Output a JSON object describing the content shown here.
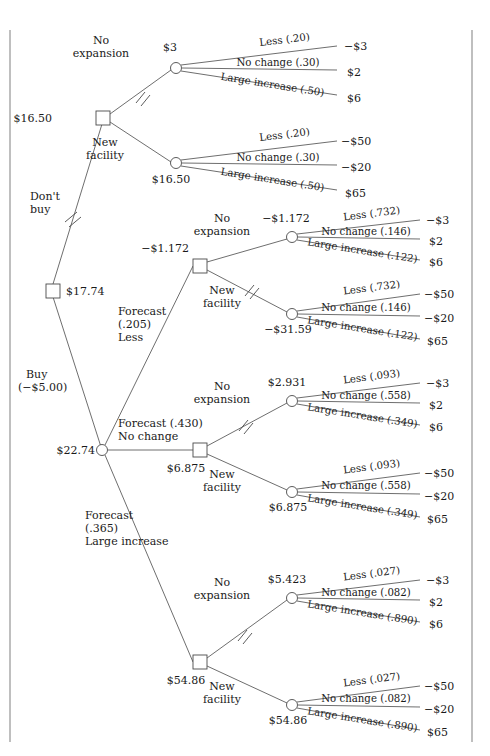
{
  "figure": {
    "type": "decision-tree"
  },
  "root": {
    "node_type": "decision",
    "value": "$17.74",
    "branches": {
      "dont_buy": "Don't\nbuy",
      "dont_buy_l1": "Don't",
      "dont_buy_l2": "buy",
      "buy_l1": "Buy",
      "buy_l2": "(−$5.00)"
    }
  },
  "no_forecast": {
    "decision_value": "$16.50",
    "branch_no_expansion_l1": "No",
    "branch_no_expansion_l2": "expansion",
    "branch_new_facility_l1": "New",
    "branch_new_facility_l2": "facility",
    "chance_no_expansion": {
      "value": "$3",
      "outcomes": [
        {
          "label": "Less (.20)",
          "payoff": "−$3"
        },
        {
          "label": "No change (.30)",
          "payoff": "$2"
        },
        {
          "label": "Large increase (.50)",
          "payoff": "$6"
        }
      ]
    },
    "chance_new_facility": {
      "value": "$16.50",
      "outcomes": [
        {
          "label": "Less (.20)",
          "payoff": "−$50"
        },
        {
          "label": "No change (.30)",
          "payoff": "−$20"
        },
        {
          "label": "Large increase (.50)",
          "payoff": "$65"
        }
      ]
    }
  },
  "buy_forecast": {
    "chance_value": "$22.74",
    "forecasts": [
      {
        "id": "less",
        "label_l1": "Forecast",
        "label_l2": "(.205)",
        "label_l3": "Less",
        "decision_value": "−$1.172",
        "branch_no_expansion_l1": "No",
        "branch_no_expansion_l2": "expansion",
        "branch_new_facility_l1": "New",
        "branch_new_facility_l2": "facility",
        "chance_no_expansion": {
          "value": "−$1.172",
          "outcomes": [
            {
              "label": "Less (.732)",
              "payoff": "−$3"
            },
            {
              "label": "No change (.146)",
              "payoff": "$2"
            },
            {
              "label": "Large increase (.122)",
              "payoff": "$6"
            }
          ]
        },
        "chance_new_facility": {
          "value": "−$31.59",
          "outcomes": [
            {
              "label": "Less (.732)",
              "payoff": "−$50"
            },
            {
              "label": "No change (.146)",
              "payoff": "−$20"
            },
            {
              "label": "Large increase (.122)",
              "payoff": "$65"
            }
          ]
        }
      },
      {
        "id": "no-change",
        "label_l1": "Forecast (.430)",
        "label_l2": "No change",
        "label_l3": "",
        "decision_value": "$6.875",
        "branch_no_expansion_l1": "No",
        "branch_no_expansion_l2": "expansion",
        "branch_new_facility_l1": "New",
        "branch_new_facility_l2": "facility",
        "chance_no_expansion": {
          "value": "$2.931",
          "outcomes": [
            {
              "label": "Less (.093)",
              "payoff": "−$3"
            },
            {
              "label": "No change (.558)",
              "payoff": "$2"
            },
            {
              "label": "Large increase (.349)",
              "payoff": "$6"
            }
          ]
        },
        "chance_new_facility": {
          "value": "$6.875",
          "outcomes": [
            {
              "label": "Less (.093)",
              "payoff": "−$50"
            },
            {
              "label": "No change (.558)",
              "payoff": "−$20"
            },
            {
              "label": "Large increase (.349)",
              "payoff": "$65"
            }
          ]
        }
      },
      {
        "id": "large-increase",
        "label_l1": "Forecast",
        "label_l2": "(.365)",
        "label_l3": "Large increase",
        "decision_value": "$54.86",
        "branch_no_expansion_l1": "No",
        "branch_no_expansion_l2": "expansion",
        "branch_new_facility_l1": "New",
        "branch_new_facility_l2": "facility",
        "chance_no_expansion": {
          "value": "$5.423",
          "outcomes": [
            {
              "label": "Less (.027)",
              "payoff": "−$3"
            },
            {
              "label": "No change (.082)",
              "payoff": "$2"
            },
            {
              "label": "Large increase (.890)",
              "payoff": "$6"
            }
          ]
        },
        "chance_new_facility": {
          "value": "$54.86",
          "outcomes": [
            {
              "label": "Less (.027)",
              "payoff": "−$50"
            },
            {
              "label": "No change (.082)",
              "payoff": "−$20"
            },
            {
              "label": "Large increase (.890)",
              "payoff": "$65"
            }
          ]
        }
      }
    ]
  },
  "colors": {
    "line": "#5d5d5d",
    "rule": "#8a8a8a",
    "text": "#1a1a1a",
    "background": "#ffffff"
  }
}
